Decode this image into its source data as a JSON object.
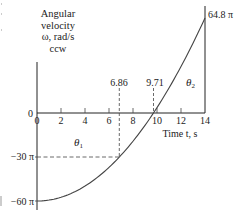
{
  "chart_data": {
    "type": "line",
    "title": "",
    "xlabel": "Time t, s",
    "ylabel_lines": [
      "Angular",
      "velocity",
      "ω, rad/s",
      "ccw"
    ],
    "xlim": [
      0,
      14
    ],
    "ylim_pi": [
      -60,
      64.8
    ],
    "x_ticks": [
      0,
      2,
      4,
      6,
      8,
      10,
      12,
      14
    ],
    "x_tick_labels": [
      "0",
      "2",
      "4",
      "6",
      "8",
      "10",
      "12",
      "14"
    ],
    "y_tick_labels": [
      {
        "value_pi": 0,
        "label": "0"
      },
      {
        "value_pi": -30,
        "label": "−30 π"
      },
      {
        "value_pi": -60,
        "label": "−60 π"
      }
    ],
    "series": [
      {
        "name": "ω(t)",
        "x": [
          0,
          2,
          4,
          6,
          6.86,
          8,
          9.71,
          12,
          14
        ],
        "y_pi": [
          -60,
          -57.6,
          -50.2,
          -38,
          -30,
          -16.6,
          0,
          32.1,
          64.8
        ]
      }
    ],
    "annotations": [
      {
        "text": "64.8 π",
        "x": 14,
        "y_pi": 64.8
      },
      {
        "text": "6.86",
        "x": 6.86,
        "type": "vertical-dashed"
      },
      {
        "text": "9.71",
        "x": 9.71,
        "type": "vertical-dashed"
      },
      {
        "text": "−30 π",
        "y_pi": -30,
        "type": "horizontal-dashed"
      },
      {
        "text": "θ1",
        "region": "between t=0 and 9.71 below axis"
      },
      {
        "text": "θ2",
        "region": "between t=9.71 and 14 above axis"
      }
    ],
    "grid": false,
    "legend": "none"
  },
  "labels": {
    "y_axis_lines": [
      "Angular",
      "velocity",
      "ω, rad/s",
      "ccw"
    ],
    "x_axis": "Time t, s",
    "peak": "64.8 π",
    "t1": "6.86",
    "t2": "9.71",
    "theta1": "θ",
    "theta1_sub": "1",
    "theta2": "θ",
    "theta2_sub": "2",
    "y0": "0",
    "y_m30": "−30 π",
    "y_m60": "−60 π"
  }
}
